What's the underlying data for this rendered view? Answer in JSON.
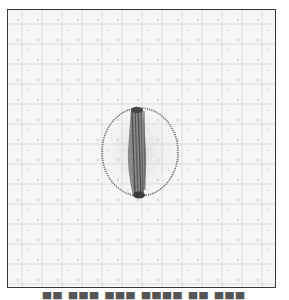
{
  "figure": {
    "frame_color": "#3a3a3a",
    "fabric_color": "#f6f6f6",
    "thread_color": "#5a5a5a",
    "stitch": {
      "type": "circle-outline-with-vertical-bar",
      "circle_center": [
        140,
        152
      ],
      "circle_radius_x": 38,
      "circle_radius_y": 44,
      "bar_x_range": [
        127,
        147
      ],
      "bar_y_range": [
        107,
        198
      ]
    },
    "caption_cropped": "caption text cut off at bottom edge"
  }
}
